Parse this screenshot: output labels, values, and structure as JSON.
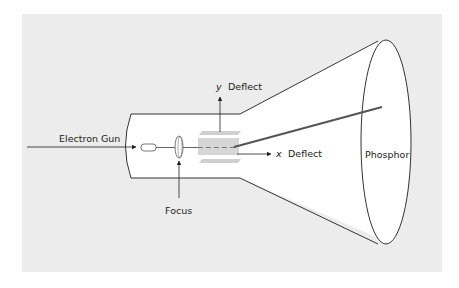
{
  "diagram": {
    "labels": {
      "electron_gun": "Electron Gun",
      "focus": "Focus",
      "y_axis": "y",
      "y_deflect": "Deflect",
      "x_axis": "x",
      "x_deflect": "Deflect",
      "phosphor": "Phosphor"
    },
    "components": [
      "electron-gun",
      "focus-lens",
      "vertical-deflection-plates",
      "horizontal-deflection-plates",
      "electron-beam",
      "phosphor-screen"
    ],
    "colors": {
      "background": "#ececec",
      "tube_fill": "#ffffff",
      "outline": "#333333",
      "beam": "#555555",
      "plates": "#cfcfcf"
    }
  }
}
